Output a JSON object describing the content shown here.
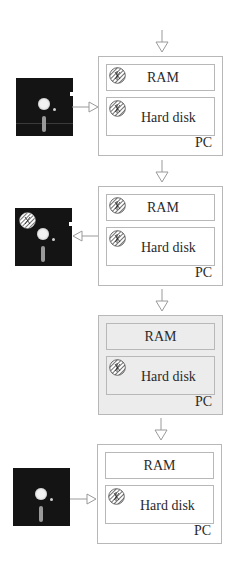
{
  "diagram": {
    "stages": [
      {
        "pc_label": "PC",
        "ram_label": "RAM",
        "hd_label": "Hard disk",
        "ram_infected": true,
        "hd_infected": true,
        "floppy_present": true,
        "floppy_infected": false,
        "floppy_arrow": "floppy-to-pc",
        "shaded": false
      },
      {
        "pc_label": "PC",
        "ram_label": "RAM",
        "hd_label": "Hard disk",
        "ram_infected": true,
        "hd_infected": true,
        "floppy_present": true,
        "floppy_infected": true,
        "floppy_arrow": "pc-to-floppy",
        "shaded": false
      },
      {
        "pc_label": "PC",
        "ram_label": "RAM",
        "hd_label": "Hard disk",
        "ram_infected": false,
        "hd_infected": true,
        "floppy_present": false,
        "shaded": true
      },
      {
        "pc_label": "PC",
        "ram_label": "RAM",
        "hd_label": "Hard disk",
        "ram_infected": false,
        "hd_infected": true,
        "floppy_present": true,
        "floppy_infected": false,
        "floppy_arrow": "floppy-to-pc",
        "shaded": false
      }
    ],
    "colors": {
      "line": "#b8b8b8",
      "floppy": "#141414",
      "shaded_fill": "#ececec",
      "text": "#2a2a2a"
    },
    "icons": {
      "virus": "hatched-circle-virus-icon",
      "floppy": "floppy-disk-icon",
      "arrow": "hollow-triangle-arrow-icon"
    }
  }
}
